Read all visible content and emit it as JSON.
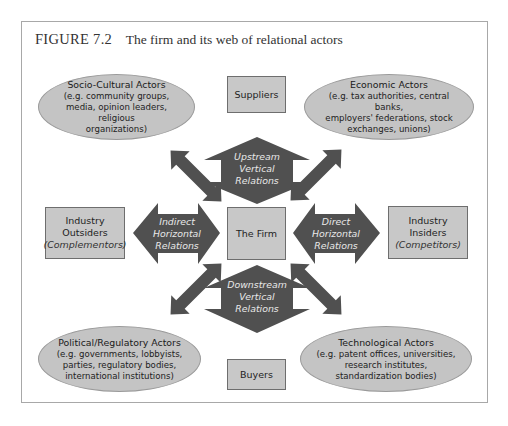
{
  "figure": {
    "number": "FIGURE 7.2",
    "caption": "The firm and its web of relational actors"
  },
  "center": {
    "label": "The Firm"
  },
  "boxes": {
    "suppliers": {
      "label": "Suppliers"
    },
    "buyers": {
      "label": "Buyers"
    },
    "outsiders": {
      "line1": "Industry",
      "line2": "Outsiders",
      "sub": "(Complementors)"
    },
    "insiders": {
      "line1": "Industry",
      "line2": "Insiders",
      "sub": "(Competitors)"
    }
  },
  "actors": {
    "socio_cultural": {
      "title": "Socio-Cultural Actors",
      "lines": [
        "(e.g. community groups,",
        "media, opinion leaders, religious",
        "organizations)"
      ]
    },
    "economic": {
      "title": "Economic Actors",
      "lines": [
        "(e.g. tax authorities, central banks,",
        "employers' federations, stock",
        "exchanges, unions)"
      ]
    },
    "political": {
      "title": "Political/Regulatory Actors",
      "lines": [
        "(e.g. governments, lobbyists,",
        "parties, regulatory bodies,",
        "international institutions)"
      ]
    },
    "technological": {
      "title": "Technological Actors",
      "lines": [
        "(e.g. patent offices, universities,",
        "research institutes,",
        "standardization bodies)"
      ]
    }
  },
  "relations": {
    "upstream": [
      "Upstream",
      "Vertical",
      "Relations"
    ],
    "downstream": [
      "Downstream",
      "Vertical",
      "Relations"
    ],
    "indirect": [
      "Indirect",
      "Horizontal",
      "Relations"
    ],
    "direct": [
      "Direct",
      "Horizontal",
      "Relations"
    ]
  },
  "colors": {
    "arrow_fill": "#505050",
    "box_fill": "#c8c8c8",
    "ellipse_fill": "#c4c4c4",
    "frame_border": "#a8a8a8"
  }
}
